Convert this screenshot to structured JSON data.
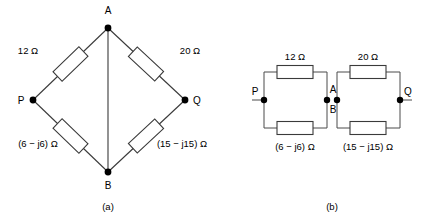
{
  "figure": {
    "background_color": "#ffffff",
    "line_color": "#3a3a3a",
    "node_color": "#000000"
  },
  "diagram_a": {
    "caption": "(a)",
    "nodes": [
      {
        "id": "A",
        "label": "A"
      },
      {
        "id": "P",
        "label": "P"
      },
      {
        "id": "Q",
        "label": "Q"
      },
      {
        "id": "B",
        "label": "B"
      }
    ],
    "components": [
      {
        "id": "AP",
        "label": "12 Ω",
        "between": "A-P"
      },
      {
        "id": "AQ",
        "label": "20 Ω",
        "between": "A-Q"
      },
      {
        "id": "PB",
        "label": "(6 − j6) Ω",
        "between": "P-B"
      },
      {
        "id": "QB",
        "label": "(15 − j15) Ω",
        "between": "Q-B"
      }
    ]
  },
  "diagram_b": {
    "caption": "(b)",
    "nodes": [
      {
        "id": "P",
        "label": "P"
      },
      {
        "id": "A",
        "label": "A"
      },
      {
        "id": "B",
        "label": "B"
      },
      {
        "id": "Q",
        "label": "Q"
      }
    ],
    "components": [
      {
        "id": "top_left",
        "label": "12 Ω",
        "between": "P-A"
      },
      {
        "id": "bottom_left",
        "label": "(6 − j6) Ω",
        "between": "P-B"
      },
      {
        "id": "top_right",
        "label": "20 Ω",
        "between": "A-Q"
      },
      {
        "id": "bottom_right",
        "label": "(15 − j15) Ω",
        "between": "B-Q"
      }
    ]
  }
}
